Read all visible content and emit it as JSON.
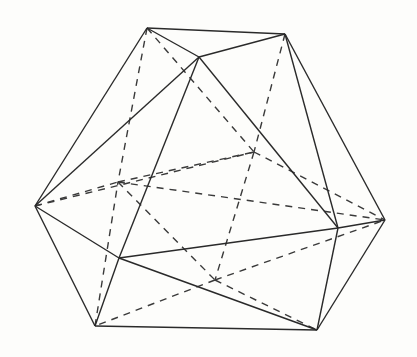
{
  "diagram": {
    "type": "icosahedron-wireframe",
    "colors": {
      "background": "#fdfdfb",
      "stroke": "#2a2a2a"
    },
    "vertices": {
      "A": [
        147,
        28
      ],
      "B": [
        285,
        34
      ],
      "C": [
        199,
        57
      ],
      "D": [
        35,
        206
      ],
      "E": [
        118,
        182
      ],
      "L": [
        254,
        152
      ],
      "F": [
        385,
        220
      ],
      "G": [
        338,
        228
      ],
      "H": [
        119,
        258
      ],
      "I": [
        215,
        280
      ],
      "J": [
        95,
        326
      ],
      "K": [
        317,
        330
      ]
    },
    "visible_edges": [
      [
        "A",
        "B"
      ],
      [
        "A",
        "C"
      ],
      [
        "C",
        "B"
      ],
      [
        "A",
        "D"
      ],
      [
        "C",
        "D"
      ],
      [
        "C",
        "H"
      ],
      [
        "C",
        "G"
      ],
      [
        "B",
        "G"
      ],
      [
        "B",
        "F"
      ],
      [
        "D",
        "H"
      ],
      [
        "D",
        "J"
      ],
      [
        "H",
        "J"
      ],
      [
        "H",
        "G"
      ],
      [
        "H",
        "K"
      ],
      [
        "J",
        "K"
      ],
      [
        "G",
        "F"
      ],
      [
        "G",
        "K"
      ],
      [
        "F",
        "K"
      ]
    ],
    "hidden_edges": [
      [
        "A",
        "E"
      ],
      [
        "A",
        "L"
      ],
      [
        "B",
        "L"
      ],
      [
        "D",
        "E"
      ],
      [
        "E",
        "F"
      ],
      [
        "E",
        "I"
      ],
      [
        "D",
        "L"
      ],
      [
        "L",
        "I"
      ],
      [
        "L",
        "F"
      ],
      [
        "I",
        "J"
      ],
      [
        "I",
        "K"
      ],
      [
        "I",
        "F"
      ],
      [
        "E",
        "L"
      ],
      [
        "J",
        "E"
      ]
    ]
  }
}
